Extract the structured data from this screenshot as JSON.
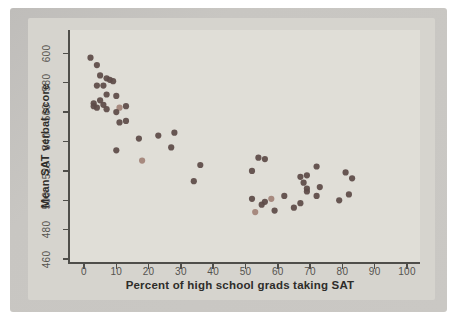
{
  "figure": {
    "bg_scan": "#c8c6c2",
    "bg_panel": "#e0ded7",
    "axis_color": "#4f4e4a",
    "tick_label_color": "#55534e",
    "title_color": "#2e2d2a"
  },
  "chart_data": {
    "type": "scatter",
    "title": "",
    "xlabel": "Percent of high school grads taking SAT",
    "ylabel": "Mean SAT verbal score",
    "xlim": [
      -5,
      105
    ],
    "ylim": [
      455,
      608
    ],
    "grid": false,
    "legend": "none",
    "x_ticks": [
      0,
      10,
      20,
      30,
      40,
      50,
      60,
      70,
      80,
      90,
      100
    ],
    "y_ticks": [
      460,
      480,
      500,
      520,
      540,
      560,
      580,
      600
    ],
    "point_color": "#5e4b48",
    "point_color_light": "#a28379",
    "points": [
      {
        "x": 2,
        "y": 597
      },
      {
        "x": 4,
        "y": 592
      },
      {
        "x": 5,
        "y": 585
      },
      {
        "x": 7,
        "y": 583
      },
      {
        "x": 8,
        "y": 582
      },
      {
        "x": 9,
        "y": 581
      },
      {
        "x": 4,
        "y": 578
      },
      {
        "x": 6,
        "y": 578
      },
      {
        "x": 7,
        "y": 572
      },
      {
        "x": 10,
        "y": 571
      },
      {
        "x": 5,
        "y": 568
      },
      {
        "x": 3,
        "y": 566
      },
      {
        "x": 3,
        "y": 564
      },
      {
        "x": 4,
        "y": 563
      },
      {
        "x": 6,
        "y": 565
      },
      {
        "x": 7,
        "y": 562
      },
      {
        "x": 11,
        "y": 563,
        "l": true
      },
      {
        "x": 13,
        "y": 564
      },
      {
        "x": 10,
        "y": 560
      },
      {
        "x": 11,
        "y": 553
      },
      {
        "x": 13,
        "y": 554
      },
      {
        "x": 10,
        "y": 534
      },
      {
        "x": 17,
        "y": 542
      },
      {
        "x": 18,
        "y": 527,
        "l": true
      },
      {
        "x": 23,
        "y": 544
      },
      {
        "x": 28,
        "y": 546
      },
      {
        "x": 27,
        "y": 536
      },
      {
        "x": 36,
        "y": 524
      },
      {
        "x": 34,
        "y": 513
      },
      {
        "x": 52,
        "y": 520
      },
      {
        "x": 54,
        "y": 529
      },
      {
        "x": 56,
        "y": 528
      },
      {
        "x": 52,
        "y": 501
      },
      {
        "x": 53,
        "y": 492,
        "l": true
      },
      {
        "x": 55,
        "y": 497
      },
      {
        "x": 56,
        "y": 499
      },
      {
        "x": 58,
        "y": 501,
        "l": true
      },
      {
        "x": 59,
        "y": 493
      },
      {
        "x": 62,
        "y": 503
      },
      {
        "x": 65,
        "y": 495
      },
      {
        "x": 67,
        "y": 498
      },
      {
        "x": 67,
        "y": 516
      },
      {
        "x": 69,
        "y": 517
      },
      {
        "x": 68,
        "y": 512
      },
      {
        "x": 69,
        "y": 508
      },
      {
        "x": 69,
        "y": 506
      },
      {
        "x": 72,
        "y": 523
      },
      {
        "x": 73,
        "y": 509
      },
      {
        "x": 72,
        "y": 503
      },
      {
        "x": 81,
        "y": 519
      },
      {
        "x": 83,
        "y": 515
      },
      {
        "x": 82,
        "y": 504
      },
      {
        "x": 79,
        "y": 500
      }
    ]
  }
}
